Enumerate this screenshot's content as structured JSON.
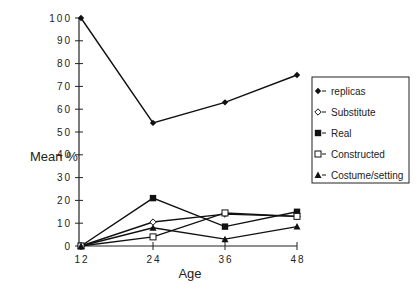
{
  "chart_data": {
    "type": "line",
    "title": "",
    "xlabel": "Age",
    "ylabel": "Mean %",
    "x": [
      12,
      24,
      36,
      48
    ],
    "x_tick_labels": [
      "12",
      "24",
      "36",
      "48"
    ],
    "y_tick_labels": [
      "0",
      "10",
      "20",
      "30",
      "40",
      "50",
      "60",
      "70",
      "80",
      "90",
      "100"
    ],
    "ylim": [
      0,
      100
    ],
    "grid": false,
    "legend_position": "right",
    "series": [
      {
        "name": "replicas",
        "marker": "filled-diamond",
        "values": [
          100,
          54,
          63,
          75
        ]
      },
      {
        "name": "Substitute",
        "marker": "open-diamond",
        "values": [
          0,
          10.5,
          14,
          13
        ]
      },
      {
        "name": "Real",
        "marker": "filled-square",
        "values": [
          0,
          21,
          8.5,
          15
        ]
      },
      {
        "name": "Constructed",
        "marker": "open-square",
        "values": [
          0,
          4,
          14.5,
          13
        ]
      },
      {
        "name": "Costume/setting",
        "marker": "filled-triangle",
        "values": [
          0,
          8,
          3,
          8.5
        ]
      }
    ]
  },
  "axes": {
    "y_label": "Mean %",
    "x_label": "Age"
  },
  "legend": {
    "items": [
      {
        "label": "replicas"
      },
      {
        "label": "Substitute"
      },
      {
        "label": "Real"
      },
      {
        "label": "Constructed"
      },
      {
        "label": "Costume/setting"
      }
    ]
  }
}
